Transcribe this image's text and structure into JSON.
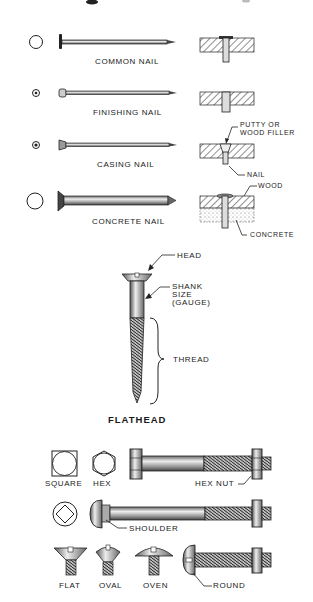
{
  "nails": {
    "common": {
      "label": "COMMON NAIL"
    },
    "finishing": {
      "label": "FINISHING NAIL"
    },
    "casing": {
      "label": "CASING NAIL",
      "callout_top_1": "PUTTY OR",
      "callout_top_2": "WOOD FILLER",
      "callout_bottom": "NAIL"
    },
    "concrete": {
      "label": "CONCRETE NAIL",
      "callout_top": "WOOD",
      "callout_bottom": "CONCRETE"
    }
  },
  "screw": {
    "title": "FLATHEAD",
    "head_label": "HEAD",
    "shank_label_1": "SHANK",
    "shank_label_2": "SIZE",
    "shank_label_3": "(GAUGE)",
    "thread_label": "THREAD"
  },
  "bolts": {
    "square_label": "SQUARE",
    "hex_label": "HEX",
    "hex_nut_label": "HEX NUT",
    "shoulder_label": "SHOULDER",
    "flat_label": "FLAT",
    "oval_label": "OVAL",
    "oven_label": "OVEN",
    "round_label": "ROUND"
  },
  "colors": {
    "ink": "#1a1a1a",
    "paper": "#ffffff",
    "metal": "#9a9a9a"
  }
}
